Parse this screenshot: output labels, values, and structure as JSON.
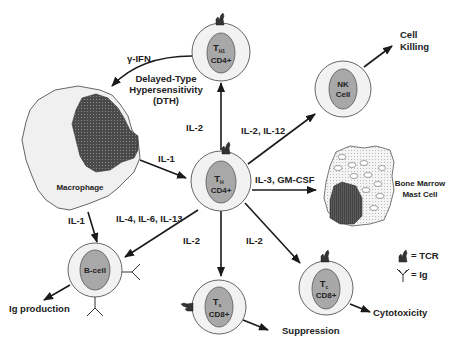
{
  "cells": {
    "th": {
      "main": "T",
      "sub": "H",
      "marker": "CD4+"
    },
    "th1": {
      "main": "T",
      "sub": "H1",
      "marker": "CD4+"
    },
    "nk": {
      "line1": "NK",
      "line2": "Cell"
    },
    "ts": {
      "main": "T",
      "sub": "s",
      "marker": "CD8+"
    },
    "tc": {
      "main": "T",
      "sub": "c",
      "marker": "CD8+"
    },
    "bcell": {
      "label": "B-cell"
    },
    "macrophage": {
      "label": "Macrophage"
    },
    "mast": {
      "line1": "Bone Marrow",
      "line2": "Mast Cell"
    }
  },
  "arrows": {
    "th_to_th1": "IL-2",
    "th_to_nk": "IL-2, IL-12",
    "th_to_mast": "IL-3, GM-CSF",
    "macrophage_to_th": "IL-1",
    "macrophage_to_bcell": "IL-1",
    "th_to_bcell": "IL-4, IL-6, IL-13",
    "th_to_ts": "IL-2",
    "th_to_tc": "IL-2",
    "th1_to_macrophage": "γ-IFN"
  },
  "outcomes": {
    "dth_line1": "Delayed-Type",
    "dth_line2": "Hypersensitivity",
    "dth_line3": "(DTH)",
    "cell_killing_1": "Cell",
    "cell_killing_2": "Killing",
    "ig_production": "Ig production",
    "suppression": "Suppression",
    "cytotoxicity": "Cytotoxicity"
  },
  "legend": {
    "tcr": "= TCR",
    "ig": "= Ig"
  },
  "colors": {
    "outer_ring": "#f2f2f2",
    "nucleus": "#a8a8a8",
    "dark_nucleus": "#555555",
    "line": "#1a1a1a"
  }
}
